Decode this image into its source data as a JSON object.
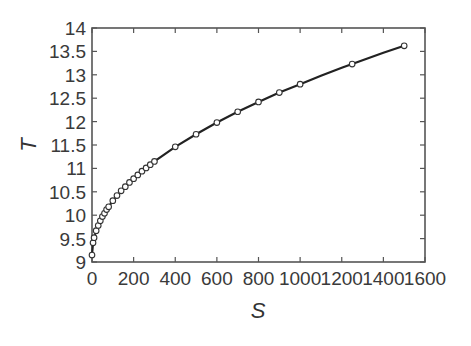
{
  "chart_data": {
    "type": "line",
    "title": "",
    "xlabel": "S",
    "ylabel": "T",
    "xlim": [
      0,
      1600
    ],
    "ylim": [
      9,
      14
    ],
    "xticks": [
      0,
      200,
      400,
      600,
      800,
      1000,
      1200,
      1400,
      1600
    ],
    "yticks": [
      9,
      9.5,
      10,
      10.5,
      11,
      11.5,
      12,
      12.5,
      13,
      13.5,
      14
    ],
    "xtick_labels": [
      "0",
      "200",
      "400",
      "600",
      "800",
      "1000",
      "1200",
      "1400",
      "1600"
    ],
    "ytick_labels": [
      "9",
      "9.5",
      "10",
      "10.5",
      "11",
      "11.5",
      "12",
      "12.5",
      "13",
      "13.5",
      "14"
    ],
    "grid": false,
    "series": [
      {
        "name": "fit",
        "style": "solid line",
        "color": "#222222",
        "x": [
          0,
          5,
          10,
          20,
          40,
          60,
          80,
          100,
          150,
          200,
          250,
          300,
          400,
          500,
          600,
          700,
          800,
          900,
          1000,
          1100,
          1200,
          1300,
          1400,
          1500
        ],
        "y": [
          9.15,
          9.41,
          9.52,
          9.67,
          9.88,
          10.04,
          10.18,
          10.31,
          10.56,
          10.78,
          10.98,
          11.15,
          11.46,
          11.73,
          11.98,
          12.21,
          12.42,
          12.62,
          12.8,
          12.98,
          13.15,
          13.31,
          13.47,
          13.62
        ]
      },
      {
        "name": "data",
        "style": "open circles",
        "color": "#333333",
        "x": [
          0,
          5,
          10,
          20,
          30,
          40,
          50,
          60,
          70,
          80,
          100,
          120,
          140,
          160,
          180,
          200,
          220,
          240,
          260,
          280,
          300,
          400,
          500,
          600,
          700,
          800,
          900,
          1000,
          1250,
          1500
        ],
        "y": [
          9.15,
          9.41,
          9.52,
          9.67,
          9.78,
          9.88,
          9.97,
          10.04,
          10.12,
          10.18,
          10.31,
          10.42,
          10.52,
          10.61,
          10.7,
          10.78,
          10.86,
          10.94,
          11.01,
          11.08,
          11.15,
          11.46,
          11.73,
          11.98,
          12.21,
          12.42,
          12.62,
          12.8,
          13.23,
          13.62
        ]
      }
    ]
  }
}
